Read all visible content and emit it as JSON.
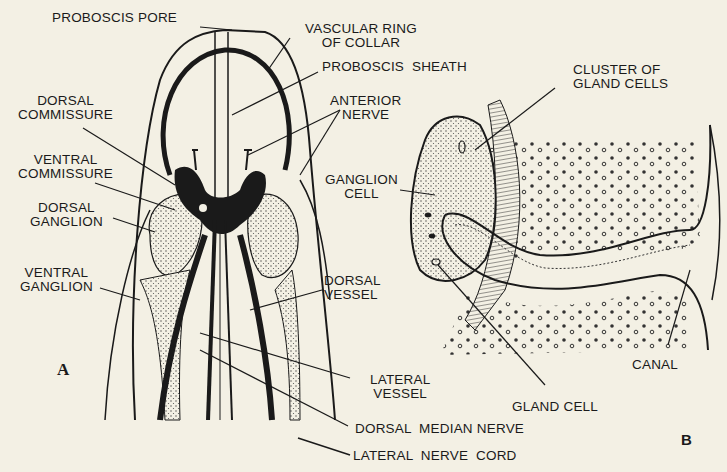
{
  "figure": {
    "panels": [
      {
        "id": "A",
        "letter": "A",
        "labels": {
          "proboscis_pore": "PROBOSCIS PORE",
          "vascular_ring": "VASCULAR RING\nOF COLLAR",
          "proboscis_sheath": "PROBOSCIS  SHEATH",
          "dorsal_commissure": "DORSAL\nCOMMISSURE",
          "anterior_nerve": "ANTERIOR\nNERVE",
          "ventral_commissure": "VENTRAL\nCOMMISSURE",
          "dorsal_ganglion": "DORSAL\nGANGLION",
          "ventral_ganglion": "VENTRAL\nGANGLION",
          "dorsal_vessel": "DORSAL\nVESSEL",
          "lateral_vessel": "LATERAL\nVESSEL",
          "dorsal_median_nerve": "DORSAL  MEDIAN NERVE",
          "lateral_nerve_cord": "LATERAL  NERVE  CORD"
        }
      },
      {
        "id": "B",
        "letter": "B",
        "labels": {
          "cluster_gland_cells": "CLUSTER OF\nGLAND CELLS",
          "ganglion_cell": "GANGLION\nCELL",
          "gland_cell": "GLAND CELL",
          "canal": "CANAL"
        }
      }
    ],
    "colors": {
      "paper": "#f3f0e4",
      "ink": "#1a1a1a",
      "stipple": "#555555"
    }
  }
}
